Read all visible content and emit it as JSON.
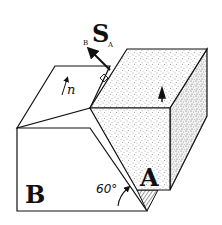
{
  "diagram": {
    "type": "two-block slip diagram",
    "labels": {
      "block_b": "B",
      "block_a": "A",
      "slip_vector_main": "S",
      "slip_vector_left_sub": "B",
      "slip_vector_right_sub": "A",
      "normal": "n",
      "angle": "60°"
    },
    "colors": {
      "line": "#111111",
      "background": "#ffffff",
      "stipple": "#555555"
    }
  }
}
